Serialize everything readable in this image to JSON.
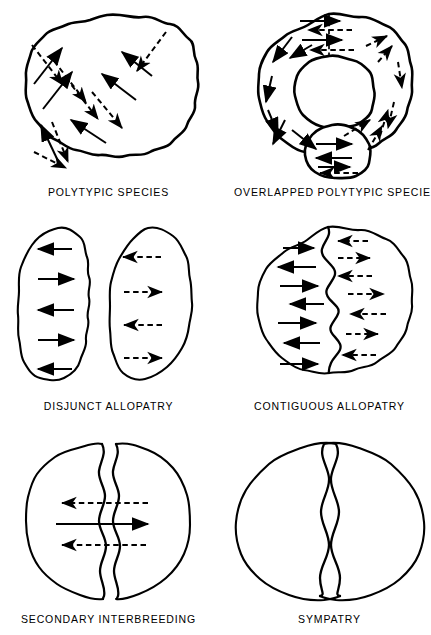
{
  "figure": {
    "background_color": "#ffffff",
    "ink_color": "#000000",
    "columns": 2,
    "rows": 3
  },
  "panels": [
    {
      "id": "polytypic",
      "label": "POLYTYPIC  SPECIES",
      "shape": "single wavy circular range",
      "row": 1,
      "column": 1,
      "arrow_solid_count": 6,
      "arrow_dashed_count": 7,
      "arrow_pattern": "interdigitating diagonal gene-flow arrows, solid running lower-left to upper-right, dashed running upper-left to lower-right",
      "contact_zone": "none"
    },
    {
      "id": "overlapped",
      "label": "OVERLAPPED  POLYTYPIC  SPECIES",
      "shape": "ring (annulus) with central hole and overlapping terminal lobe at bottom",
      "row": 1,
      "column": 2,
      "arrow_solid_count": 11,
      "arrow_dashed_count": 9,
      "arrow_pattern": "arrows follow the ring clockwise on one side and counter-clockwise on the other, meeting at the top contact line and overlapping in the bottom lobe",
      "contact_zone": "vertical dashed line at top of ring"
    },
    {
      "id": "disjunct",
      "label": "DISJUNCT  ALLOPATRY",
      "shape": "two separate oval ranges with a gap between them",
      "row": 2,
      "column": 1,
      "arrow_solid_count": 5,
      "arrow_dashed_count": 4,
      "arrow_pattern": "solid horizontal arrows alternate direction inside the left range; dashed horizontal arrows alternate direction inside the right range; no arrows cross the gap",
      "contact_zone": "none"
    },
    {
      "id": "contiguous",
      "label": "CONTIGUOUS  ALLOPATRY",
      "shape": "single wavy circular range divided by a sinuous internal boundary",
      "row": 2,
      "column": 2,
      "arrow_solid_count": 7,
      "arrow_dashed_count": 7,
      "arrow_pattern": "solid horizontal arrows alternate direction left of the boundary; dashed horizontal arrows alternate direction right of it; none cross the boundary",
      "contact_zone": "sinuous shared border down the middle"
    },
    {
      "id": "secondary",
      "label": "SECONDARY  INTERBREEDING",
      "shape": "two wavy ranges meeting in a narrow vertical zone of overlap",
      "row": 3,
      "column": 1,
      "arrow_solid_count": 1,
      "arrow_dashed_count": 2,
      "arrow_pattern": "one solid arrow crosses the narrow overlap zone to the right; two dashed arrows cross to the left, indicating gene exchange",
      "contact_zone": "narrow vertical band of overlap"
    },
    {
      "id": "sympatry",
      "label": "SYMPATRY",
      "shape": "two broadly overlapping wavy ranges sharing most of their area",
      "row": 3,
      "column": 2,
      "arrow_solid_count": 0,
      "arrow_dashed_count": 0,
      "arrow_pattern": "no arrows drawn",
      "contact_zone": "broad overlap of both ranges"
    }
  ]
}
